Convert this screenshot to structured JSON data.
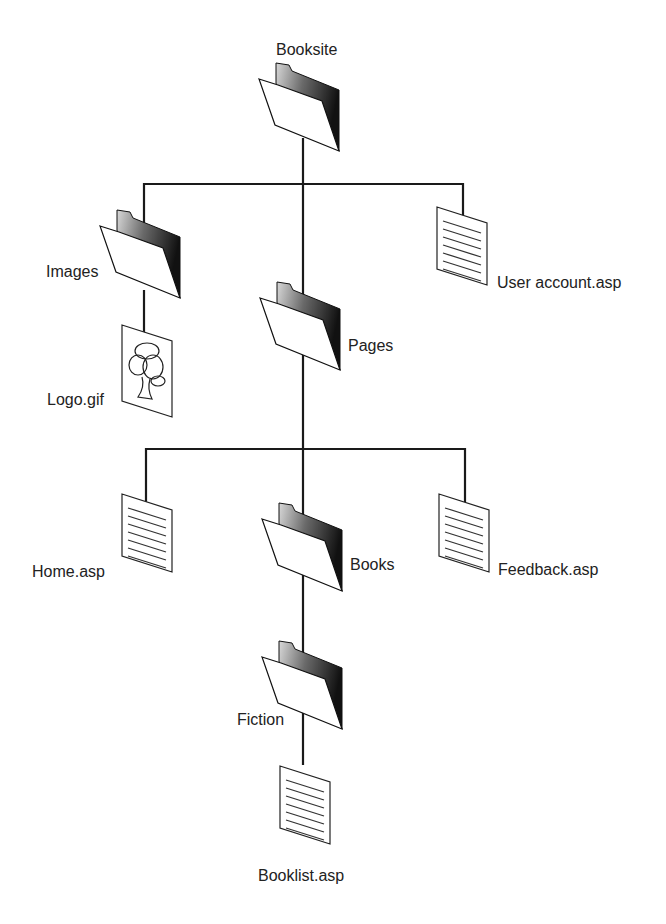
{
  "diagram": {
    "type": "site-structure-tree",
    "colors": {
      "line": "#1a1a1a",
      "text": "#222222",
      "background": "#ffffff"
    },
    "nodes": {
      "root": {
        "label": "Booksite",
        "icon": "folder-icon"
      },
      "images": {
        "label": "Images",
        "icon": "folder-icon"
      },
      "logo": {
        "label": "Logo.gif",
        "icon": "image-file-icon"
      },
      "pages": {
        "label": "Pages",
        "icon": "folder-icon"
      },
      "user_account": {
        "label": "User account.asp",
        "icon": "document-icon"
      },
      "home": {
        "label": "Home.asp",
        "icon": "document-icon"
      },
      "books": {
        "label": "Books",
        "icon": "folder-icon"
      },
      "feedback": {
        "label": "Feedback.asp",
        "icon": "document-icon"
      },
      "fiction": {
        "label": "Fiction",
        "icon": "folder-icon"
      },
      "booklist": {
        "label": "Booklist.asp",
        "icon": "document-icon"
      }
    },
    "edges": [
      [
        "Booksite",
        "Images"
      ],
      [
        "Booksite",
        "Pages"
      ],
      [
        "Booksite",
        "User account.asp"
      ],
      [
        "Images",
        "Logo.gif"
      ],
      [
        "Pages",
        "Home.asp"
      ],
      [
        "Pages",
        "Books"
      ],
      [
        "Pages",
        "Feedback.asp"
      ],
      [
        "Books",
        "Fiction"
      ],
      [
        "Fiction",
        "Booklist.asp"
      ]
    ]
  }
}
